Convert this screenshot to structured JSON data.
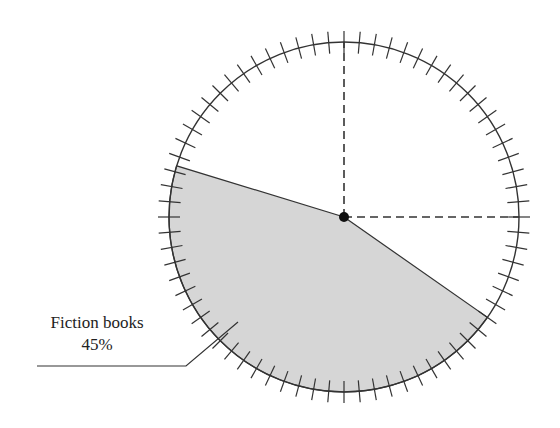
{
  "chart_data": {
    "type": "pie",
    "title": "",
    "slices": [
      {
        "label": "Fiction books",
        "value": 45,
        "value_label": "45%",
        "highlighted": true
      }
    ],
    "geometry": {
      "center": [
        344,
        217
      ],
      "radius": 175,
      "slice_start_deg": 35,
      "slice_end_deg": 197,
      "tick_count": 72,
      "tick_half_length": 11,
      "reference_lines": [
        "vertical-up",
        "horizontal-right"
      ]
    }
  },
  "annotation": {
    "name": "Fiction books",
    "percent": "45%",
    "leader": [
      [
        238,
        322
      ],
      [
        186,
        366
      ],
      [
        37,
        366
      ]
    ]
  },
  "colors": {
    "slice_fill": "#d6d6d6",
    "stroke": "#333333",
    "background": "#ffffff"
  }
}
